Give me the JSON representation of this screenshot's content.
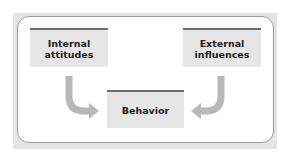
{
  "diagram": {
    "nodes": [
      {
        "id": "internal",
        "label_line1": "Internal",
        "label_line2": "attitudes"
      },
      {
        "id": "external",
        "label_line1": "External",
        "label_line2": "influences"
      },
      {
        "id": "behavior",
        "label_line1": "Behavior"
      }
    ],
    "edges": [
      {
        "from": "internal",
        "to": "behavior"
      },
      {
        "from": "external",
        "to": "behavior"
      }
    ],
    "colors": {
      "box_fill": "#e6e6e6",
      "box_top_rule": "#6e6e6e",
      "arrow": "#b8b8b8",
      "frame": "#e4e4e4",
      "panel_border": "#9a9a9a"
    }
  }
}
